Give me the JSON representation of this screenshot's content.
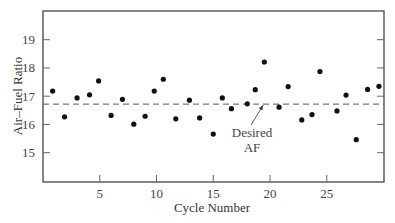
{
  "chart_data": {
    "type": "scatter",
    "title": "",
    "xlabel": "Cycle Number",
    "ylabel": "Air–Fuel Ratio",
    "xlim": [
      0,
      30
    ],
    "ylim": [
      14,
      20
    ],
    "grid": false,
    "legend": null,
    "x_ticks": [
      5,
      10,
      15,
      20,
      25
    ],
    "y_ticks": [
      15,
      16,
      17,
      18,
      19
    ],
    "x": [
      1,
      2,
      3,
      4,
      5,
      6,
      7,
      8,
      9,
      10,
      11,
      12,
      13,
      14,
      15,
      16,
      17,
      18,
      19,
      20,
      21,
      22,
      23,
      24,
      25,
      26,
      27,
      28,
      29,
      30
    ],
    "x_plot": [
      0.85,
      1.9,
      3.0,
      4.1,
      4.9,
      6.0,
      7.0,
      8.0,
      9.0,
      9.8,
      10.6,
      11.7,
      12.9,
      13.8,
      15.0,
      15.8,
      16.6,
      18.0,
      18.7,
      19.5,
      20.8,
      21.6,
      22.8,
      23.7,
      24.4,
      25.9,
      26.7,
      27.6,
      28.6,
      29.6
    ],
    "series": [
      {
        "name": "Air-Fuel Ratio",
        "values": [
          17.18,
          16.27,
          16.94,
          17.05,
          17.54,
          16.32,
          16.89,
          16.01,
          16.29,
          17.18,
          17.6,
          16.2,
          16.86,
          16.23,
          15.66,
          16.94,
          16.56,
          16.73,
          17.23,
          18.21,
          16.61,
          17.34,
          16.16,
          16.35,
          17.87,
          16.48,
          17.04,
          15.46,
          17.24,
          17.35
        ]
      }
    ],
    "reference_line": {
      "name": "Desired AF",
      "y": 16.72,
      "style": "dashed"
    },
    "annotations": [
      {
        "text_lines": [
          "Desired",
          "AF"
        ],
        "points_to": {
          "x": 19.4,
          "y": 16.72
        }
      }
    ]
  },
  "labels": {
    "xlabel": "Cycle Number",
    "ylabel": "Air–Fuel Ratio",
    "annotation_line1": "Desired",
    "annotation_line2": "AF"
  }
}
